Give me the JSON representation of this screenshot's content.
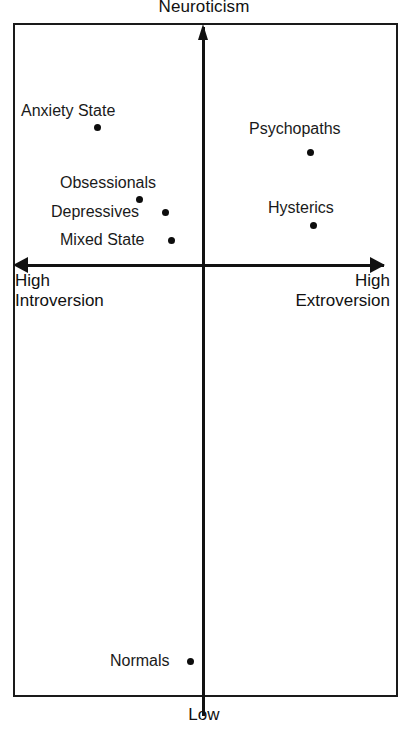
{
  "figure": {
    "title": "Neuroticism",
    "bottom_label": "Low",
    "axis_left_label": "High\nIntroversion",
    "axis_right_label": "High\nExtroversion"
  },
  "chart_data": {
    "type": "scatter",
    "title": "Neuroticism",
    "xlabel": "Introversion – Extroversion",
    "ylabel": "Neuroticism",
    "axis_labels": {
      "top": "Neuroticism",
      "bottom": "Low",
      "left": "High Introversion",
      "right": "High Extroversion"
    },
    "xlim": [
      -1,
      1
    ],
    "ylim": [
      -1,
      1
    ],
    "grid": false,
    "legend": "none",
    "quadrant_axes": {
      "x_axis_y_fraction": 0.36,
      "y_axis_x_fraction": 0.5,
      "vertical_arrow": "up",
      "horizontal_arrows": "both"
    },
    "points": [
      {
        "name": "Anxiety State",
        "label_position": "above",
        "x": -0.56,
        "y": 0.58,
        "px": 97,
        "py": 127,
        "label_px": 21,
        "label_py": 102
      },
      {
        "name": "Psychopaths",
        "label_position": "above",
        "x": 0.55,
        "y": 0.47,
        "px": 310,
        "py": 152,
        "label_px": 249,
        "label_py": 120
      },
      {
        "name": "Obsessionals",
        "label_position": "above",
        "x": -0.33,
        "y": 0.27,
        "px": 139,
        "py": 199,
        "label_px": 60,
        "label_py": 174
      },
      {
        "name": "Hysterics",
        "label_position": "above",
        "x": 0.57,
        "y": 0.16,
        "px": 313,
        "py": 225,
        "label_px": 268,
        "label_py": 199
      },
      {
        "name": "Depressives",
        "label_position": "left",
        "x": -0.19,
        "y": 0.21,
        "px": 165,
        "py": 212,
        "label_px": 51,
        "label_py": 203
      },
      {
        "name": "Mixed State",
        "label_position": "left",
        "x": -0.16,
        "y": 0.11,
        "px": 171,
        "py": 240,
        "label_px": 60,
        "label_py": 231
      },
      {
        "name": "Normals",
        "label_position": "left",
        "x": -0.07,
        "y": -0.92,
        "px": 190,
        "py": 661,
        "label_px": 110,
        "label_py": 652
      }
    ]
  }
}
